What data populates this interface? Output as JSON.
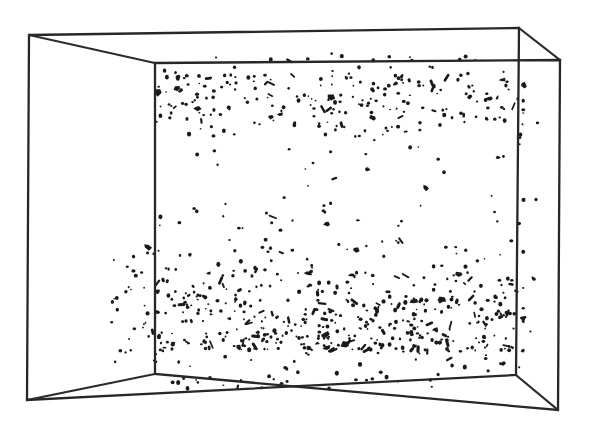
{
  "figure": {
    "title": "",
    "kind": "scatter-3d-box",
    "background_color": "#ffffff",
    "line_color": "#272727",
    "particle_color": "#1a1a1a",
    "caption": ""
  },
  "box": {
    "label": "wireframe-perspective-box",
    "front_face": {
      "x": 155,
      "y": 63,
      "width": 361,
      "height": 312
    },
    "depth_offset": {
      "dx": -126,
      "dy": -28
    },
    "outer_front_offset": {
      "dx": 44,
      "dy": 35
    },
    "corners": {
      "back_top_left": [
        29,
        35
      ],
      "back_top_right": [
        519,
        28
      ],
      "back_bottom_left": [
        27,
        400
      ],
      "back_bottom_right": [
        516,
        375
      ],
      "front_top_left": [
        155,
        63
      ],
      "front_top_right": [
        560,
        60
      ],
      "front_bottom_left": [
        155,
        374
      ],
      "front_bottom_right": [
        558,
        410
      ]
    }
  },
  "chart_data": {
    "type": "scatter",
    "title": "",
    "xlabel": "",
    "ylabel": "",
    "legend": [],
    "grid": false,
    "xlim": [
      0,
      1
    ],
    "ylim": [
      0,
      1
    ],
    "bands": [
      {
        "name": "upper-band",
        "y_center_frac": 0.13,
        "y_spread_frac": 0.13,
        "count": 300,
        "peak_density_y_frac": 0.04
      },
      {
        "name": "lower-band",
        "y_center_frac": 0.82,
        "y_spread_frac": 0.17,
        "count": 560,
        "peak_density_y_frac": 0.92
      },
      {
        "name": "sparse-gap",
        "y_center_frac": 0.47,
        "y_spread_frac": 0.1,
        "count": 14,
        "peak_density_y_frac": 0.47
      }
    ],
    "total_points": 874
  }
}
